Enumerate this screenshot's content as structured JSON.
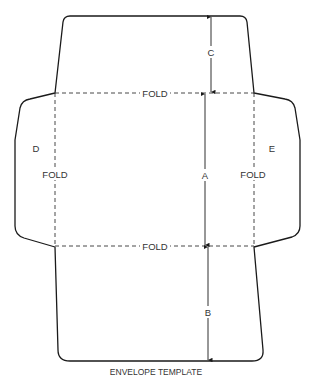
{
  "diagram": {
    "title": "ENVELOPE TEMPLATE",
    "labels": {
      "fold_top": "FOLD",
      "fold_bottom": "FOLD",
      "fold_left": "FOLD",
      "fold_right": "FOLD",
      "flap_left": "D",
      "flap_right": "E",
      "dim_top": "C",
      "dim_middle": "A",
      "dim_bottom": "B"
    },
    "colors": {
      "outline": "#1a1a1a",
      "fold": "#333333",
      "text": "#333333"
    }
  }
}
